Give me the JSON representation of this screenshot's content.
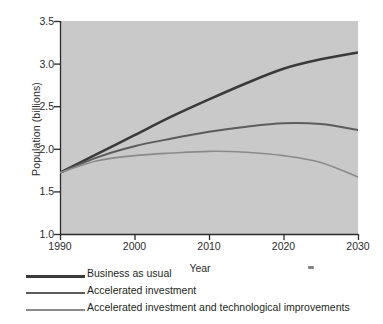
{
  "chart_data": {
    "type": "line",
    "title": "",
    "xlabel": "Year",
    "ylabel": "Population (billions)",
    "xlim": [
      1990,
      2030
    ],
    "ylim": [
      1.0,
      3.5
    ],
    "xticks": [
      1990,
      2000,
      2010,
      2020,
      2030
    ],
    "yticks": [
      "1.0",
      "1.5",
      "2.0",
      "2.5",
      "3.0",
      "3.5"
    ],
    "grid": false,
    "legend_position": "below-plot-left",
    "plot_background": "#c9c9c9",
    "x": [
      1990,
      1995,
      2000,
      2005,
      2010,
      2015,
      2020,
      2025,
      2030
    ],
    "series": [
      {
        "name": "Business as usual",
        "color": "#3a3a3a",
        "linewidth": 2.6,
        "values": [
          1.72,
          1.94,
          2.16,
          2.38,
          2.58,
          2.77,
          2.94,
          3.05,
          3.13
        ]
      },
      {
        "name": "Accelerated investment",
        "color": "#5c5c5c",
        "linewidth": 2.0,
        "values": [
          1.72,
          1.9,
          2.03,
          2.12,
          2.2,
          2.26,
          2.3,
          2.29,
          2.22
        ]
      },
      {
        "name": "Accelerated investment and technological improvements",
        "color": "#8a8a8a",
        "linewidth": 1.6,
        "values": [
          1.72,
          1.86,
          1.92,
          1.95,
          1.97,
          1.96,
          1.92,
          1.84,
          1.67
        ]
      }
    ],
    "annotations": []
  },
  "axes": {
    "y_title": "Population (billions)",
    "x_title": "Year",
    "y_tick_labels": [
      "3.5",
      "3.0",
      "2.5",
      "2.0",
      "1.5",
      "1.0"
    ],
    "x_tick_labels": [
      "1990",
      "2000",
      "2010",
      "2020",
      "2030"
    ]
  },
  "legend": {
    "items": [
      {
        "label": "Business as usual",
        "color": "#3a3a3a",
        "thickness": "3px"
      },
      {
        "label": "Accelerated investment",
        "color": "#5c5c5c",
        "thickness": "2px"
      },
      {
        "label": "Accelerated investment and technological improvements",
        "color": "#8a8a8a",
        "thickness": "1.5px"
      }
    ]
  },
  "colors": {
    "plot_background": "#c9c9c9",
    "page_background": "#ffffff",
    "axis": "#2b2b2b",
    "text": "#231f20"
  }
}
